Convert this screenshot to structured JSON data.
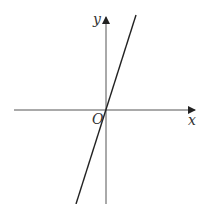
{
  "diagram": {
    "title": "",
    "axes": {
      "x_label": "x",
      "y_label": "y",
      "origin_label": "O"
    },
    "line": {
      "description": "straight line through the origin with positive slope",
      "passes_through_origin": true
    },
    "colors": {
      "axis": "#555555",
      "line": "#222222",
      "background": "#ffffff"
    }
  }
}
